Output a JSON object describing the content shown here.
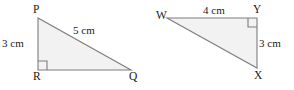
{
  "figure": {
    "type": "geometry-diagram",
    "background_color": "#ffffff",
    "fill_color": "#f2f2f2",
    "stroke_color": "#7d7d7d",
    "text_color": "#1a1a1a",
    "triangles": [
      {
        "id": "pqr",
        "name": "triangle-pqr",
        "right_angle_at": "R",
        "vertices": [
          {
            "label": "P",
            "x": 38,
            "y": 18
          },
          {
            "label": "Q",
            "x": 131,
            "y": 70
          },
          {
            "label": "R",
            "x": 38,
            "y": 70
          }
        ],
        "sides": [
          {
            "label": "3 cm",
            "between": "P-R",
            "value": 3,
            "unit": "cm"
          },
          {
            "label": "5 cm",
            "between": "P-Q",
            "value": 5,
            "unit": "cm"
          }
        ]
      },
      {
        "id": "wxy",
        "name": "triangle-wxy",
        "right_angle_at": "Y",
        "vertices": [
          {
            "label": "W",
            "x": 167,
            "y": 18
          },
          {
            "label": "X",
            "x": 257,
            "y": 68
          },
          {
            "label": "Y",
            "x": 257,
            "y": 18
          }
        ],
        "sides": [
          {
            "label": "4 cm",
            "between": "W-Y",
            "value": 4,
            "unit": "cm"
          },
          {
            "label": "3 cm",
            "between": "Y-X",
            "value": 3,
            "unit": "cm"
          }
        ]
      }
    ]
  }
}
